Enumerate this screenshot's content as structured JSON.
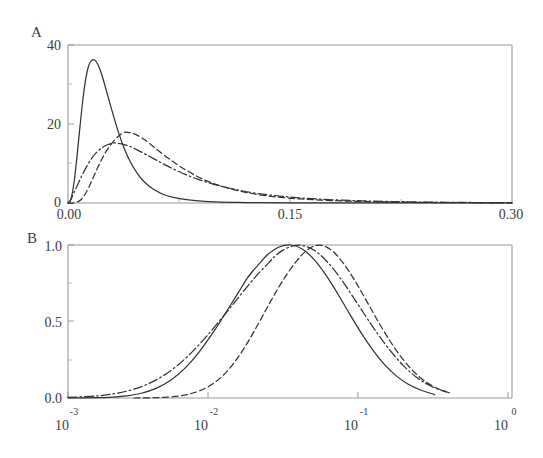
{
  "figure": {
    "background_color": "#ffffff",
    "ink_color": "#333333",
    "axis_color": "#9a9a9a"
  },
  "panels": {
    "a": {
      "letter": "A",
      "y_ticks": [
        "0",
        "20",
        "40"
      ],
      "x_ticks": [
        "0.00",
        "0.15",
        "0.30"
      ]
    },
    "b": {
      "letter": "B",
      "y_ticks": [
        "0.0",
        "0.5",
        "1.0"
      ],
      "x_ticks": [
        {
          "mantissa": "10",
          "exponent": "-3"
        },
        {
          "mantissa": "10",
          "exponent": "-2"
        },
        {
          "mantissa": "10",
          "exponent": "-1"
        },
        {
          "mantissa": "10",
          "exponent": "0"
        }
      ]
    }
  },
  "chart_data": [
    {
      "id": "panel-a",
      "type": "line",
      "title": "A",
      "xlabel": "",
      "ylabel": "",
      "xlim": [
        0.0,
        0.3
      ],
      "ylim": [
        0,
        40
      ],
      "xticks": [
        0.0,
        0.15,
        0.3
      ],
      "xticklabels": [
        "0.00",
        "0.15",
        "0.30"
      ],
      "yticks": [
        0,
        20,
        40
      ],
      "yticklabels": [
        "0",
        "20",
        "40"
      ],
      "xminorticks": [
        0.075,
        0.225
      ],
      "yminorticks": [
        10,
        30
      ],
      "grid": false,
      "legend": "none",
      "xscale": "linear",
      "yscale": "linear",
      "series": [
        {
          "name": "curve-1",
          "linestyle": "solid",
          "distribution": "lognormal-like probability density",
          "peak_x": 0.019,
          "peak_y": 36.2,
          "x": [
            0.0,
            0.002,
            0.004,
            0.006,
            0.008,
            0.01,
            0.012,
            0.014,
            0.016,
            0.018,
            0.02,
            0.022,
            0.024,
            0.027,
            0.03,
            0.034,
            0.038,
            0.042,
            0.047,
            0.052,
            0.058,
            0.065,
            0.072,
            0.08,
            0.09,
            0.1,
            0.115,
            0.13,
            0.15,
            0.175,
            0.2,
            0.23,
            0.26,
            0.3
          ],
          "y": [
            0.0,
            1.0,
            5.0,
            11.5,
            19.0,
            26.0,
            31.5,
            34.8,
            36.1,
            36.2,
            35.2,
            33.4,
            31.0,
            27.0,
            23.0,
            18.0,
            13.8,
            10.5,
            7.4,
            5.2,
            3.4,
            2.1,
            1.35,
            0.85,
            0.48,
            0.28,
            0.14,
            0.08,
            0.04,
            0.02,
            0.01,
            0.005,
            0.003,
            0.001
          ]
        },
        {
          "name": "curve-2",
          "linestyle": "dashed",
          "distribution": "lognormal-like probability density",
          "peak_x": 0.0385,
          "peak_y": 17.9,
          "x": [
            0.0,
            0.004,
            0.008,
            0.011,
            0.014,
            0.017,
            0.02,
            0.023,
            0.026,
            0.03,
            0.034,
            0.038,
            0.042,
            0.046,
            0.051,
            0.056,
            0.062,
            0.069,
            0.076,
            0.085,
            0.095,
            0.107,
            0.12,
            0.135,
            0.152,
            0.17,
            0.195,
            0.22,
            0.25,
            0.275,
            0.3
          ],
          "y": [
            0.0,
            0.05,
            0.6,
            1.9,
            3.9,
            6.4,
            8.9,
            11.2,
            13.2,
            15.3,
            16.9,
            17.9,
            17.8,
            17.3,
            16.2,
            14.8,
            13.0,
            11.0,
            9.2,
            7.2,
            5.4,
            3.9,
            2.7,
            1.8,
            1.15,
            0.75,
            0.42,
            0.24,
            0.12,
            0.07,
            0.04
          ]
        },
        {
          "name": "curve-3",
          "linestyle": "dashdot",
          "distribution": "lognormal-like probability density",
          "peak_x": 0.0335,
          "peak_y": 15.2,
          "x": [
            0.0,
            0.002,
            0.004,
            0.007,
            0.01,
            0.013,
            0.016,
            0.019,
            0.023,
            0.027,
            0.031,
            0.034,
            0.038,
            0.042,
            0.047,
            0.053,
            0.06,
            0.068,
            0.077,
            0.087,
            0.098,
            0.112,
            0.128,
            0.145,
            0.165,
            0.19,
            0.215,
            0.245,
            0.275,
            0.3
          ],
          "y": [
            0.0,
            0.9,
            2.6,
            5.0,
            7.4,
            9.5,
            11.3,
            12.7,
            14.0,
            14.8,
            15.2,
            15.1,
            14.8,
            14.3,
            13.4,
            12.2,
            10.8,
            9.2,
            7.6,
            6.1,
            4.8,
            3.5,
            2.4,
            1.7,
            1.1,
            0.65,
            0.4,
            0.22,
            0.12,
            0.08
          ]
        }
      ]
    },
    {
      "id": "panel-b",
      "type": "line",
      "title": "B",
      "xlabel": "",
      "ylabel": "",
      "xlim": [
        0.001,
        1.0
      ],
      "ylim": [
        0.0,
        1.0
      ],
      "xscale": "log",
      "yscale": "linear",
      "xticks": [
        0.001,
        0.01,
        0.1,
        1.0
      ],
      "xticklabels": [
        "10^-3",
        "10^-2",
        "10^-1",
        "10^0"
      ],
      "yticks": [
        0.0,
        0.5,
        1.0
      ],
      "yticklabels": [
        "0.0",
        "0.5",
        "1.0"
      ],
      "yminorticks": [
        0.25,
        0.75
      ],
      "grid": false,
      "legend": "none",
      "series": [
        {
          "name": "curve-1",
          "linestyle": "solid",
          "distribution": "normalized gaussian in log10(x)",
          "peak_log10x": -1.74,
          "peak_y": 1.0,
          "sigma_decades": 0.3,
          "log10x": [
            -3.0,
            -2.8,
            -2.7,
            -2.6,
            -2.5,
            -2.4,
            -2.3,
            -2.2,
            -2.1,
            -2.0,
            -1.92,
            -1.84,
            -1.78,
            -1.74,
            -1.7,
            -1.64,
            -1.56,
            -1.48,
            -1.4,
            -1.32,
            -1.24,
            -1.16,
            -1.08,
            -1.0,
            -0.92,
            -0.84,
            -0.76,
            -0.68,
            -0.6,
            -0.5
          ],
          "y": [
            0.0,
            0.002,
            0.006,
            0.014,
            0.031,
            0.063,
            0.116,
            0.197,
            0.308,
            0.443,
            0.564,
            0.687,
            0.78,
            0.83,
            0.873,
            0.936,
            0.987,
            1.0,
            0.972,
            0.903,
            0.802,
            0.68,
            0.55,
            0.424,
            0.311,
            0.216,
            0.143,
            0.09,
            0.054,
            0.022
          ]
        },
        {
          "name": "curve-2",
          "linestyle": "dashdot",
          "distribution": "normalized gaussian in log10(x)",
          "peak_log10x": -1.585,
          "peak_y": 1.0,
          "sigma_decades": 0.36,
          "log10x": [
            -3.0,
            -2.85,
            -2.75,
            -2.65,
            -2.55,
            -2.45,
            -2.35,
            -2.25,
            -2.15,
            -2.05,
            -1.95,
            -1.87,
            -1.79,
            -1.71,
            -1.63,
            -1.585,
            -1.54,
            -1.46,
            -1.38,
            -1.3,
            -1.22,
            -1.14,
            -1.06,
            -0.98,
            -0.9,
            -0.82,
            -0.72,
            -0.62,
            -0.52,
            -0.42
          ],
          "y": [
            0.004,
            0.01,
            0.019,
            0.034,
            0.058,
            0.094,
            0.146,
            0.216,
            0.305,
            0.409,
            0.524,
            0.618,
            0.714,
            0.805,
            0.885,
            0.93,
            0.963,
            0.996,
            0.992,
            0.951,
            0.877,
            0.779,
            0.666,
            0.549,
            0.435,
            0.331,
            0.218,
            0.133,
            0.075,
            0.039
          ]
        },
        {
          "name": "curve-3",
          "linestyle": "dashed",
          "distribution": "normalized gaussian in log10(x)",
          "peak_log10x": -1.445,
          "peak_y": 1.0,
          "sigma_decades": 0.26,
          "log10x": [
            -2.55,
            -2.45,
            -2.35,
            -2.25,
            -2.18,
            -2.1,
            -2.02,
            -1.94,
            -1.86,
            -1.78,
            -1.7,
            -1.62,
            -1.54,
            -1.445,
            -1.36,
            -1.28,
            -1.2,
            -1.12,
            -1.04,
            -0.96,
            -0.88,
            -0.8,
            -0.72,
            -0.64,
            -0.56,
            -0.48,
            -0.4
          ],
          "y": [
            0.0,
            0.001,
            0.004,
            0.012,
            0.024,
            0.048,
            0.088,
            0.15,
            0.24,
            0.355,
            0.489,
            0.629,
            0.76,
            0.891,
            0.974,
            0.999,
            0.963,
            0.878,
            0.76,
            0.627,
            0.491,
            0.366,
            0.257,
            0.17,
            0.106,
            0.062,
            0.034
          ]
        }
      ]
    }
  ]
}
